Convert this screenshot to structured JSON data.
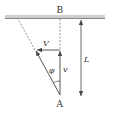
{
  "diagram": {
    "labels": {
      "top_point": "B",
      "bottom_point": "A",
      "horizontal_velocity": "V",
      "vertical_velocity": "v",
      "angle": "φ",
      "length": "L"
    },
    "colors": {
      "ceiling": "#c8c8c8",
      "ceiling_edge": "#8a8a8a",
      "line": "#444444"
    }
  }
}
